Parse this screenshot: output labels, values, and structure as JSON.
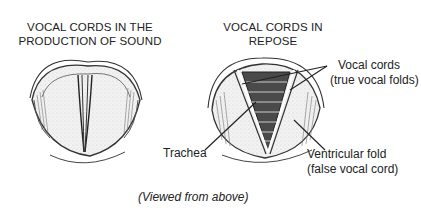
{
  "figure": {
    "left_panel": {
      "title_line1": "VOCAL CORDS IN THE",
      "title_line2": "PRODUCTION OF SOUND"
    },
    "right_panel": {
      "title_line1": "VOCAL CORDS IN",
      "title_line2": "REPOSE"
    },
    "labels": {
      "vocal_cords_line1": "Vocal cords",
      "vocal_cords_line2": "(true vocal folds)",
      "trachea": "Trachea",
      "ventricular_fold_line1": "Ventricular fold",
      "ventricular_fold_line2": "(false vocal cord)"
    },
    "caption": "(Viewed from above)",
    "colors": {
      "ink": "#222222",
      "trachea_fill": "#4a4a4a",
      "tissue_fill": "#d9d9d9",
      "background": "#ffffff"
    }
  }
}
